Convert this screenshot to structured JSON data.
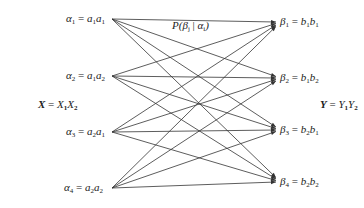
{
  "diagram": {
    "type": "channel-transition-graph",
    "input_set": {
      "name": "X",
      "expression": [
        "X",
        "1",
        "X",
        "2"
      ]
    },
    "output_set": {
      "name": "Y",
      "expression": [
        "Y",
        "1",
        "Y",
        "2"
      ]
    },
    "edge_label": {
      "p": "P(",
      "beta": "β",
      "j": "j",
      "bar": " | ",
      "alpha": "α",
      "i": "i",
      "close": ")"
    },
    "inputs": [
      {
        "sym": "α",
        "idx": "1",
        "a": "a",
        "i1": "1",
        "b": "a",
        "i2": "1",
        "x": 112,
        "y": 19
      },
      {
        "sym": "α",
        "idx": "2",
        "a": "a",
        "i1": "1",
        "b": "a",
        "i2": "2",
        "x": 112,
        "y": 76
      },
      {
        "sym": "α",
        "idx": "3",
        "a": "a",
        "i1": "2",
        "b": "a",
        "i2": "1",
        "x": 112,
        "y": 132
      },
      {
        "sym": "α",
        "idx": "4",
        "a": "a",
        "i1": "2",
        "b": "a",
        "i2": "2",
        "x": 112,
        "y": 188
      }
    ],
    "outputs": [
      {
        "sym": "β",
        "idx": "1",
        "a": "b",
        "i1": "1",
        "b": "b",
        "i2": "1",
        "x": 276,
        "y": 22
      },
      {
        "sym": "β",
        "idx": "2",
        "a": "b",
        "i1": "1",
        "b": "b",
        "i2": "2",
        "x": 276,
        "y": 78
      },
      {
        "sym": "β",
        "idx": "3",
        "a": "b",
        "i1": "2",
        "b": "b",
        "i2": "1",
        "x": 276,
        "y": 130
      },
      {
        "sym": "β",
        "idx": "4",
        "a": "b",
        "i1": "2",
        "b": "b",
        "i2": "2",
        "x": 276,
        "y": 182
      }
    ],
    "edges": "complete bipartite: every input αi connects to every output βj (16 arrows)",
    "colors": {
      "line": "#333333",
      "text": "#222222",
      "background": "#ffffff"
    }
  }
}
